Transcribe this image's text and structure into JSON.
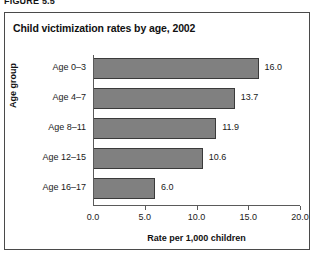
{
  "figure": {
    "label": "FIGURE 5.5"
  },
  "chart_data": {
    "type": "bar",
    "orientation": "horizontal",
    "title": "Child victimization rates by age, 2002",
    "categories": [
      "Age 0–3",
      "Age 4–7",
      "Age 8–11",
      "Age 12–15",
      "Age 16–17"
    ],
    "values": [
      16.0,
      13.7,
      11.9,
      10.6,
      6.0
    ],
    "value_labels": [
      "16.0",
      "13.7",
      "11.9",
      "10.6",
      "6.0"
    ],
    "xlabel": "Rate per 1,000 children",
    "ylabel": "Age group",
    "xlim": [
      0,
      20
    ],
    "xticks": [
      0,
      5,
      10,
      15,
      20
    ],
    "xtick_labels": [
      "0.0",
      "5.0",
      "10.0",
      "15.0",
      "20.0"
    ],
    "grid": false,
    "legend": null,
    "bar_color": "#808080",
    "bar_border_color": "#3a3a3a"
  }
}
